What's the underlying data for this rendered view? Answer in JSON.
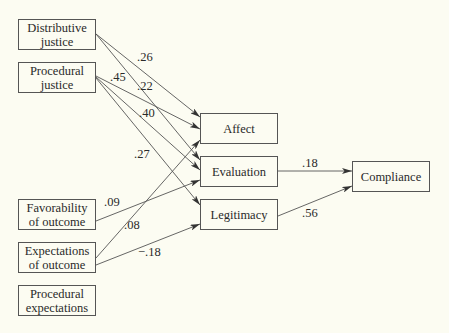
{
  "nodes": {
    "distributive_justice": {
      "label": "Distributive\njustice"
    },
    "procedural_justice": {
      "label": "Procedural\njustice"
    },
    "favorability_of_outcome": {
      "label": "Favorability\nof outcome"
    },
    "expectations_of_outcome": {
      "label": "Expectations\nof outcome"
    },
    "procedural_expectations": {
      "label": "Procedural\nexpectations"
    },
    "affect": {
      "label": "Affect"
    },
    "evaluation": {
      "label": "Evaluation"
    },
    "legitimacy": {
      "label": "Legitimacy"
    },
    "compliance": {
      "label": "Compliance"
    }
  },
  "edges": [
    {
      "from": "Distributive justice",
      "to": "Affect",
      "coef": ".26"
    },
    {
      "from": "Distributive justice",
      "to": "Evaluation",
      "coef": ".22"
    },
    {
      "from": "Procedural justice",
      "to": "Affect",
      "coef": ".45"
    },
    {
      "from": "Procedural justice",
      "to": "Evaluation",
      "coef": ".40"
    },
    {
      "from": "Procedural justice",
      "to": "Legitimacy",
      "coef": ".27"
    },
    {
      "from": "Favorability of outcome",
      "to": "Evaluation",
      "coef": ".09"
    },
    {
      "from": "Expectations of outcome",
      "to": "Affect",
      "coef": ".08"
    },
    {
      "from": "Expectations of outcome",
      "to": "Legitimacy",
      "coef": "−.18"
    },
    {
      "from": "Evaluation",
      "to": "Compliance",
      "coef": ".18"
    },
    {
      "from": "Legitimacy",
      "to": "Compliance",
      "coef": ".56"
    }
  ],
  "colors": {
    "background": "#fcfcf2",
    "stroke": "#555555",
    "text": "#2a2a2a"
  }
}
